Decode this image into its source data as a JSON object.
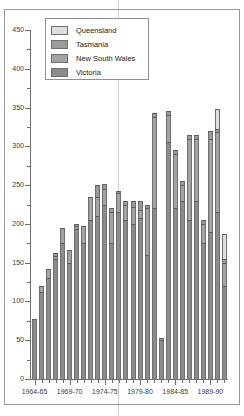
{
  "chart_data": {
    "type": "bar",
    "stacked": true,
    "title": "",
    "subtitle": "",
    "xlabel": "",
    "ylabel": "",
    "ylim": [
      0,
      450
    ],
    "ytick_step": 50,
    "yminor_step": 25,
    "grid": false,
    "legend_position": "top-left",
    "ytick_labels": [
      "0",
      "50",
      "100",
      "150",
      "200",
      "250",
      "300",
      "350",
      "400",
      "450"
    ],
    "ytick_values": [
      0,
      50,
      100,
      150,
      200,
      250,
      300,
      350,
      400,
      450
    ],
    "xtick_labels": [
      "1964-65",
      "1969-70",
      "1974-75",
      "1979-80",
      "1984-85",
      "1989-90"
    ],
    "xtick_indices": [
      0,
      5,
      10,
      15,
      20,
      25
    ],
    "categories": [
      "1964-65",
      "1965-66",
      "1966-67",
      "1967-68",
      "1968-69",
      "1969-70",
      "1970-71",
      "1971-72",
      "1972-73",
      "1973-74",
      "1974-75",
      "1975-76",
      "1976-77",
      "1977-78",
      "1978-79",
      "1979-80",
      "1980-81",
      "1981-82",
      "1982-83",
      "1983-84",
      "1984-85",
      "1985-86",
      "1986-87",
      "1987-88",
      "1988-89",
      "1989-90",
      "1990-91",
      "1991-92"
    ],
    "series": [
      {
        "name": "Victoria",
        "color": "#8c8c8c",
        "values": [
          77,
          112,
          130,
          155,
          175,
          150,
          194,
          175,
          205,
          210,
          225,
          175,
          215,
          205,
          200,
          207,
          160,
          220,
          50,
          305,
          220,
          230,
          205,
          230,
          175,
          190,
          215,
          120
        ]
      },
      {
        "name": "New South Wales",
        "color": "#a3a3a3",
        "values": [
          0,
          8,
          12,
          3,
          20,
          16,
          3,
          22,
          30,
          25,
          20,
          40,
          25,
          20,
          22,
          11,
          60,
          118,
          3,
          35,
          70,
          20,
          105,
          80,
          25,
          120,
          103,
          30
        ]
      },
      {
        "name": "Tasmania",
        "color": "#9a9a9a",
        "values": [
          0,
          0,
          0,
          4,
          0,
          0,
          3,
          0,
          0,
          15,
          6,
          5,
          3,
          5,
          8,
          12,
          5,
          5,
          0,
          5,
          5,
          5,
          5,
          5,
          5,
          10,
          5,
          5
        ]
      },
      {
        "name": "Queensland",
        "color": "#dedede",
        "values": [
          0,
          0,
          0,
          0,
          0,
          0,
          0,
          0,
          0,
          0,
          0,
          0,
          0,
          0,
          0,
          0,
          0,
          0,
          0,
          0,
          0,
          0,
          0,
          0,
          0,
          0,
          25,
          32
        ]
      }
    ],
    "totals": [
      77,
      120,
      142,
      162,
      195,
      166,
      200,
      197,
      235,
      250,
      251,
      220,
      243,
      230,
      230,
      230,
      225,
      343,
      53,
      345,
      295,
      255,
      315,
      315,
      205,
      320,
      348,
      187
    ]
  },
  "legend": {
    "items": [
      {
        "label": "Queensland",
        "color": "#dedede"
      },
      {
        "label": "Tasmania",
        "color": "#9a9a9a"
      },
      {
        "label": "New South Wales",
        "color": "#a3a3a3"
      },
      {
        "label": "Victoria",
        "color": "#8c8c8c"
      }
    ]
  }
}
